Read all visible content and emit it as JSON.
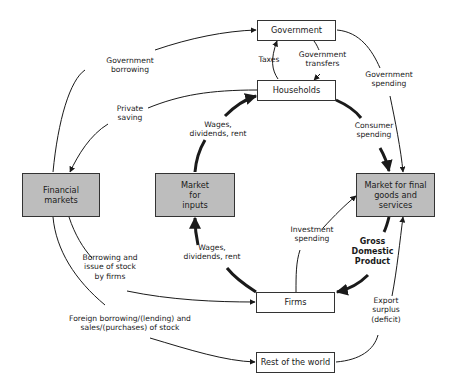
{
  "boxes": {
    "government": "Government",
    "households": "Households",
    "financial_markets": "Financial\nmarkets",
    "market_inputs": "Market\nfor\ninputs",
    "market_final": "Market for final\ngoods and\nservices",
    "firms": "Firms",
    "rest_of_world": "Rest of the world"
  },
  "flows": {
    "government_borrowing": "Government\nborrowing",
    "private_saving": "Private\nsaving",
    "taxes": "Taxes",
    "government_transfers": "Government\ntransfers",
    "government_spending": "Government\nspending",
    "wages_top": "Wages,\ndividends, rent",
    "consumer_spending": "Consumer\nspending",
    "investment_spending": "Investment\nspending",
    "gdp": "Gross\nDomestic\nProduct",
    "wages_bottom": "Wages,\ndividends, rent",
    "borrowing_issue_stock": "Borrowing and\nissue of stock\nby firms",
    "foreign_borrowing": "Foreign borrowing/(lending) and\nsales/(purchases) of stock",
    "export_surplus": "Export\nsurplus\n(deficit)"
  },
  "colors": {
    "box_fill_gray": "#bdbdbd",
    "line": "#1a1a1a"
  }
}
